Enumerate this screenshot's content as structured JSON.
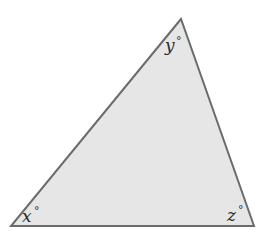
{
  "diagram": {
    "type": "triangle",
    "fill_color": "#e6e6e6",
    "stroke_color": "#6b6b6b",
    "vertices": {
      "top": {
        "x": 181,
        "y": 19
      },
      "bottom_left": {
        "x": 11,
        "y": 226
      },
      "bottom_right": {
        "x": 254,
        "y": 226
      }
    },
    "angles": [
      {
        "id": "x",
        "variable": "x",
        "degree_symbol": "°",
        "vertex": "bottom_left"
      },
      {
        "id": "y",
        "variable": "y",
        "degree_symbol": "°",
        "vertex": "top"
      },
      {
        "id": "z",
        "variable": "z",
        "degree_symbol": "°",
        "vertex": "bottom_right"
      }
    ]
  }
}
